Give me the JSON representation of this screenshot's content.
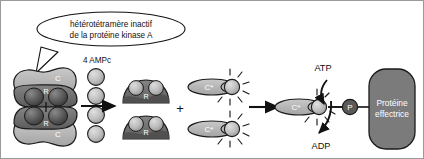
{
  "figure": {
    "title_callout": {
      "line1": "hétérotétramère inactif",
      "line2": "de la protéine kinase A"
    },
    "ligand_label": "4 AMPc",
    "plus_sign": "+",
    "labels": {
      "regulatory_subunit": "R",
      "catalytic_subunit": "C",
      "active_catalytic_subunit": "C*",
      "phosphate": "P",
      "atp": "ATP",
      "adp": "ADP",
      "effector_protein_line1": "Protéine",
      "effector_protein_line2": "effectrice"
    },
    "colors": {
      "catalytic_fill": "#b8b8b8",
      "regulatory_fill": "#6e6e6e",
      "ampc_fill": "#bcbcbc",
      "effector_fill": "#7b7b7b",
      "phosphate_fill": "#5a5a5a",
      "outline": "#1a1a1a",
      "background": "#ffffff",
      "text": "#111111",
      "label_text": "#ffffff"
    },
    "holoenzyme": {
      "catalytic_top": "C",
      "regulatory_top": "R",
      "regulatory_bottom": "R",
      "catalytic_bottom": "C"
    },
    "ampc_molecules": [
      {
        "name": "ampc-1"
      },
      {
        "name": "ampc-2"
      },
      {
        "name": "ampc-3"
      },
      {
        "name": "ampc-4"
      }
    ],
    "r_dimers": [
      {
        "label": "R",
        "bound_ampc": 2
      },
      {
        "label": "R",
        "bound_ampc": 2
      }
    ],
    "released_catalytic": [
      {
        "label": "C*"
      },
      {
        "label": "C*"
      }
    ]
  }
}
